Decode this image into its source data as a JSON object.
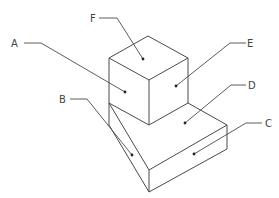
{
  "diagram": {
    "type": "isometric-part-drawing",
    "labels": [
      {
        "id": "A",
        "text": "A",
        "x": 11,
        "y": 47,
        "path": "24,43 41,43 125,92",
        "dot": [
          125,
          92
        ]
      },
      {
        "id": "B",
        "text": "B",
        "x": 59,
        "y": 103,
        "path": "70,99 87,99 132,155",
        "dot": [
          132,
          155
        ]
      },
      {
        "id": "C",
        "text": "C",
        "x": 265,
        "y": 127,
        "path": "262,123 246,123 194,154",
        "dot": [
          194,
          154
        ]
      },
      {
        "id": "D",
        "text": "D",
        "x": 248,
        "y": 89,
        "path": "246,85 231,85 185,123",
        "dot": [
          185,
          123
        ]
      },
      {
        "id": "E",
        "text": "E",
        "x": 247,
        "y": 47,
        "path": "246,43 230,43 176,86",
        "dot": [
          176,
          86
        ]
      },
      {
        "id": "F",
        "text": "F",
        "x": 90,
        "y": 22,
        "path": "99,18 117,18 143,59",
        "dot": [
          143,
          59
        ]
      }
    ],
    "colors": {
      "line": "#4a4a4a",
      "dot": "#222222",
      "text": "#444444",
      "background": "#ffffff"
    }
  }
}
